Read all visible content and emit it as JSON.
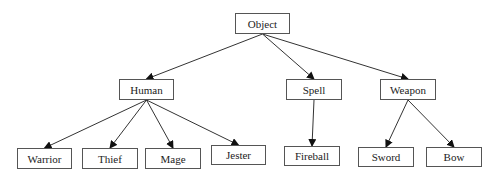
{
  "diagram": {
    "type": "class-hierarchy-tree",
    "nodes": [
      {
        "id": "object",
        "label": "Object",
        "x": 235,
        "y": 13,
        "w": 55,
        "h": 21
      },
      {
        "id": "human",
        "label": "Human",
        "x": 119,
        "y": 79,
        "w": 55,
        "h": 21
      },
      {
        "id": "spell",
        "label": "Spell",
        "x": 286,
        "y": 79,
        "w": 56,
        "h": 21
      },
      {
        "id": "weapon",
        "label": "Weapon",
        "x": 380,
        "y": 79,
        "w": 56,
        "h": 21
      },
      {
        "id": "warrior",
        "label": "Warrior",
        "x": 17,
        "y": 148,
        "w": 55,
        "h": 21
      },
      {
        "id": "thief",
        "label": "Thief",
        "x": 82,
        "y": 148,
        "w": 56,
        "h": 21
      },
      {
        "id": "mage",
        "label": "Mage",
        "x": 145,
        "y": 148,
        "w": 56,
        "h": 21
      },
      {
        "id": "jester",
        "label": "Jester",
        "x": 211,
        "y": 145,
        "w": 55,
        "h": 20
      },
      {
        "id": "fireball",
        "label": "Fireball",
        "x": 284,
        "y": 146,
        "w": 56,
        "h": 20
      },
      {
        "id": "sword",
        "label": "Sword",
        "x": 358,
        "y": 147,
        "w": 56,
        "h": 20
      },
      {
        "id": "bow",
        "label": "Bow",
        "x": 426,
        "y": 147,
        "w": 56,
        "h": 20
      }
    ],
    "edges": [
      {
        "from": "object",
        "to": "human"
      },
      {
        "from": "object",
        "to": "spell"
      },
      {
        "from": "object",
        "to": "weapon"
      },
      {
        "from": "human",
        "to": "warrior"
      },
      {
        "from": "human",
        "to": "thief"
      },
      {
        "from": "human",
        "to": "mage"
      },
      {
        "from": "human",
        "to": "jester"
      },
      {
        "from": "spell",
        "to": "fireball"
      },
      {
        "from": "weapon",
        "to": "sword"
      },
      {
        "from": "weapon",
        "to": "bow"
      }
    ],
    "colors": {
      "border": "#555555",
      "edge": "#333333",
      "text": "#222222"
    }
  }
}
